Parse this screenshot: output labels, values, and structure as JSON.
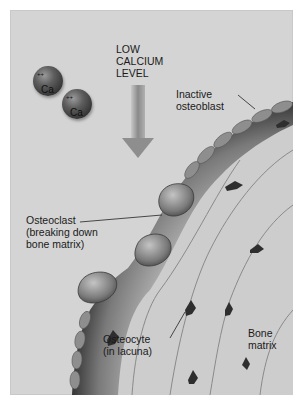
{
  "diagram": {
    "title": "LOW CALCIUM LEVEL",
    "title_lines": [
      "LOW",
      "CALCIUM",
      "LEVEL"
    ],
    "ions": [
      {
        "symbol": "Ca",
        "charge": "++"
      },
      {
        "symbol": "Ca",
        "charge": "++"
      }
    ],
    "labels": {
      "inactive_osteoblast": [
        "Inactive",
        "osteoblast"
      ],
      "osteoclast": [
        "Osteoclast",
        "(breaking down",
        "bone matrix)"
      ],
      "osteocyte": [
        "Osteocyte",
        "(in lacuna)"
      ],
      "bone_matrix": [
        "Bone",
        "matrix"
      ]
    },
    "colors": {
      "background": "#d4d4d4",
      "bone_surface": "#4a4a4a",
      "matrix": "#cfcfcf",
      "ion": "#3a3a3a"
    }
  }
}
